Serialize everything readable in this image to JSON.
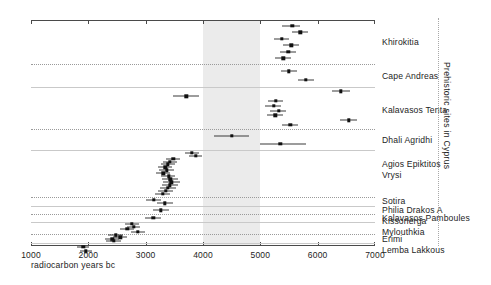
{
  "chart_data": {
    "type": "scatter",
    "title": "",
    "xlabel": "radiocarbon years bc",
    "ylabel": "Prehistoric sites in Cyprus",
    "xlim": [
      1000,
      7000
    ],
    "xticks": [
      1000,
      2000,
      3000,
      4000,
      5000,
      6000,
      7000
    ],
    "xtick_labels": [
      "1000",
      "2000",
      "3000",
      "4000",
      "5000",
      "6000",
      "7000"
    ],
    "axis_direction": "left-to-right increasing",
    "grid": false,
    "legend": "none",
    "shaded_band": {
      "from": 4000,
      "to": 5000,
      "color": "#ebebeb",
      "note": "shaded vertical band"
    },
    "marker": "filled square with horizontal 1-sigma error bar",
    "groups": [
      {
        "name": "Khirokitia",
        "label_lines": [
          "Khirokitia"
        ],
        "points": [
          {
            "x": 5560,
            "err_low": 5380,
            "err_high": 5690
          },
          {
            "x": 5700,
            "err_low": 5560,
            "err_high": 5840
          },
          {
            "x": 5370,
            "err_low": 5230,
            "err_high": 5500
          },
          {
            "x": 5540,
            "err_low": 5400,
            "err_high": 5680
          },
          {
            "x": 5490,
            "err_low": 5350,
            "err_high": 5620
          },
          {
            "x": 5400,
            "err_low": 5250,
            "err_high": 5530
          }
        ]
      },
      {
        "name": "Cape Andreas",
        "label_lines": [
          "Cape Andreas"
        ],
        "points": [
          {
            "x": 5500,
            "err_low": 5360,
            "err_high": 5640
          },
          {
            "x": 5790,
            "err_low": 5650,
            "err_high": 5930
          }
        ]
      },
      {
        "name": "Kalavasos Tenta",
        "label_lines": [
          "Kalavasos Tenta"
        ],
        "points": [
          {
            "x": 6400,
            "err_low": 6250,
            "err_high": 6560
          },
          {
            "x": 3710,
            "err_low": 3480,
            "err_high": 3930
          },
          {
            "x": 5270,
            "err_low": 5140,
            "err_high": 5400
          },
          {
            "x": 5230,
            "err_low": 5090,
            "err_high": 5360
          },
          {
            "x": 5320,
            "err_low": 5170,
            "err_high": 5450
          },
          {
            "x": 5260,
            "err_low": 5120,
            "err_high": 5390
          },
          {
            "x": 6540,
            "err_low": 6390,
            "err_high": 6690
          },
          {
            "x": 5520,
            "err_low": 5380,
            "err_high": 5650
          }
        ]
      },
      {
        "name": "Dhali Agridhi",
        "label_lines": [
          "Dhali Agridhi"
        ],
        "points": [
          {
            "x": 4500,
            "err_low": 4200,
            "err_high": 4810
          },
          {
            "x": 5350,
            "err_low": 5000,
            "err_high": 5800
          }
        ]
      },
      {
        "name": "Agios Epiktitos Vrysi",
        "label_lines": [
          "Agios Epiktitos",
          "Vrysi"
        ],
        "points": [
          {
            "x": 3810,
            "err_low": 3690,
            "err_high": 3930
          },
          {
            "x": 3870,
            "err_low": 3750,
            "err_high": 3990
          },
          {
            "x": 3480,
            "err_low": 3350,
            "err_high": 3600
          },
          {
            "x": 3420,
            "err_low": 3300,
            "err_high": 3540
          },
          {
            "x": 3390,
            "err_low": 3260,
            "err_high": 3510
          },
          {
            "x": 3340,
            "err_low": 3210,
            "err_high": 3460
          },
          {
            "x": 3370,
            "err_low": 3240,
            "err_high": 3490
          },
          {
            "x": 3310,
            "err_low": 3180,
            "err_high": 3430
          },
          {
            "x": 3400,
            "err_low": 3270,
            "err_high": 3520
          },
          {
            "x": 3430,
            "err_low": 3290,
            "err_high": 3560
          },
          {
            "x": 3450,
            "err_low": 3310,
            "err_high": 3600
          },
          {
            "x": 3420,
            "err_low": 3280,
            "err_high": 3560
          },
          {
            "x": 3390,
            "err_low": 3250,
            "err_high": 3530
          },
          {
            "x": 3350,
            "err_low": 3220,
            "err_high": 3480
          },
          {
            "x": 3300,
            "err_low": 3160,
            "err_high": 3430
          }
        ]
      },
      {
        "name": "Sotira",
        "label_lines": [
          "Sotira"
        ],
        "points": [
          {
            "x": 3140,
            "err_low": 3000,
            "err_high": 3270
          },
          {
            "x": 3330,
            "err_low": 3190,
            "err_high": 3470
          }
        ]
      },
      {
        "name": "Philia Drakos A",
        "label_lines": [
          "Philia Drakos A"
        ],
        "points": [
          {
            "x": 3260,
            "err_low": 3120,
            "err_high": 3400
          }
        ]
      },
      {
        "name": "Kalavasos Pamboules",
        "label_lines": [
          "Kalavasos Pamboules"
        ],
        "points": [
          {
            "x": 3130,
            "err_low": 2990,
            "err_high": 3270
          }
        ]
      },
      {
        "name": "Kissonerga Mylouthkia",
        "label_lines": [
          "Kissonerga",
          "Mylouthkia"
        ],
        "points": [
          {
            "x": 2760,
            "err_low": 2640,
            "err_high": 2880
          },
          {
            "x": 2790,
            "err_low": 2670,
            "err_high": 2910
          },
          {
            "x": 2680,
            "err_low": 2560,
            "err_high": 2800
          },
          {
            "x": 2860,
            "err_low": 2740,
            "err_high": 2980
          }
        ]
      },
      {
        "name": "Erimi",
        "label_lines": [
          "Erimi"
        ],
        "points": [
          {
            "x": 2480,
            "err_low": 2350,
            "err_high": 2600
          },
          {
            "x": 2560,
            "err_low": 2430,
            "err_high": 2680
          },
          {
            "x": 2420,
            "err_low": 2290,
            "err_high": 2540
          },
          {
            "x": 2440,
            "err_low": 2300,
            "err_high": 2570
          }
        ]
      },
      {
        "name": "Lemba Lakkous",
        "label_lines": [
          "Lemba Lakkous"
        ],
        "points": [
          {
            "x": 1910,
            "err_low": 1810,
            "err_high": 2010
          },
          {
            "x": 1960,
            "err_low": 1850,
            "err_high": 2070
          }
        ]
      }
    ]
  }
}
